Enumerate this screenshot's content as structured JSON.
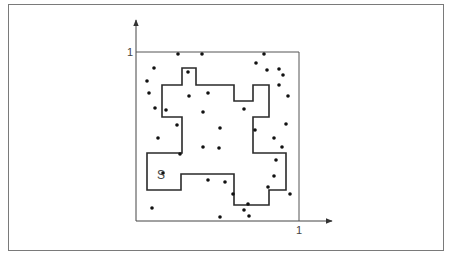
{
  "figure": {
    "type": "monte-carlo-area-estimate",
    "region_label": "S",
    "axes": {
      "x_tick_label": "1",
      "y_tick_label": "1",
      "x_range": [
        0,
        1
      ],
      "y_range": [
        0,
        1
      ]
    },
    "colors": {
      "frame": "#7a7a7a",
      "axis": "#444444",
      "region_outline": "#2a2a2a",
      "points": "#111111"
    },
    "unit_square_px": {
      "x0": 136,
      "y0": 52,
      "x1": 299,
      "y1": 221
    },
    "region_polygon_px": [
      [
        182,
        68
      ],
      [
        196,
        68
      ],
      [
        196,
        85
      ],
      [
        234,
        85
      ],
      [
        234,
        101
      ],
      [
        253,
        101
      ],
      [
        253,
        85
      ],
      [
        269,
        85
      ],
      [
        269,
        117
      ],
      [
        253,
        117
      ],
      [
        253,
        153
      ],
      [
        286,
        153
      ],
      [
        286,
        190
      ],
      [
        269,
        190
      ],
      [
        269,
        205
      ],
      [
        234,
        205
      ],
      [
        234,
        174
      ],
      [
        181,
        174
      ],
      [
        181,
        190
      ],
      [
        147,
        190
      ],
      [
        147,
        153
      ],
      [
        182,
        153
      ],
      [
        182,
        117
      ],
      [
        162,
        117
      ],
      [
        162,
        85
      ],
      [
        182,
        85
      ]
    ],
    "points_px": [
      [
        178,
        54
      ],
      [
        202,
        54
      ],
      [
        264,
        54
      ],
      [
        154,
        68
      ],
      [
        256,
        63
      ],
      [
        147,
        81
      ],
      [
        267,
        70
      ],
      [
        279,
        69
      ],
      [
        283,
        75
      ],
      [
        149,
        93
      ],
      [
        188,
        72
      ],
      [
        279,
        85
      ],
      [
        166,
        110
      ],
      [
        155,
        108
      ],
      [
        189,
        96
      ],
      [
        208,
        93
      ],
      [
        203,
        112
      ],
      [
        244,
        109
      ],
      [
        288,
        96
      ],
      [
        158,
        138
      ],
      [
        177,
        125
      ],
      [
        220,
        128
      ],
      [
        286,
        124
      ],
      [
        274,
        138
      ],
      [
        282,
        147
      ],
      [
        255,
        130
      ],
      [
        180,
        154
      ],
      [
        219,
        148
      ],
      [
        203,
        147
      ],
      [
        276,
        160
      ],
      [
        163,
        173
      ],
      [
        268,
        187
      ],
      [
        208,
        180
      ],
      [
        233,
        194
      ],
      [
        225,
        182
      ],
      [
        290,
        194
      ],
      [
        152,
        208
      ],
      [
        220,
        217
      ],
      [
        248,
        204
      ],
      [
        249,
        216
      ],
      [
        244,
        210
      ],
      [
        274,
        176
      ]
    ]
  }
}
